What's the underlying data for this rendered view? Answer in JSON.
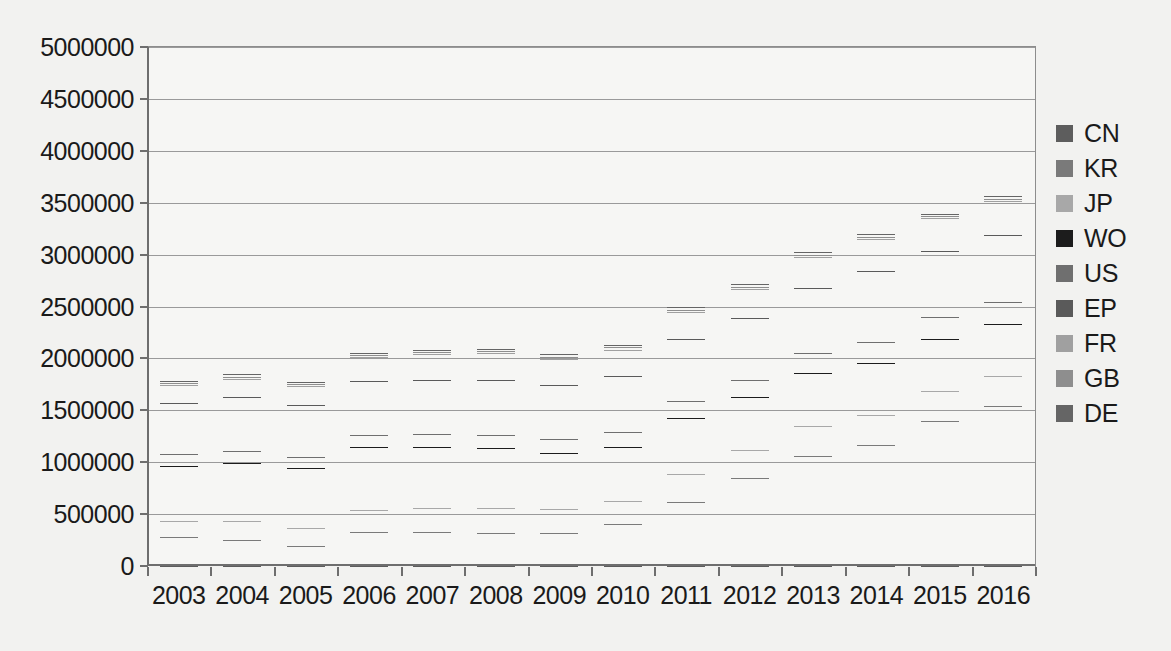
{
  "chart_data": {
    "type": "bar",
    "subtype": "stacked-bar",
    "title": "",
    "xlabel": "",
    "ylabel": "",
    "grid": true,
    "legend_position": "right",
    "ylim": [
      0,
      5000000
    ],
    "ytick_step": 500000,
    "ytick_labels": [
      "5000000",
      "4500000",
      "4000000",
      "3500000",
      "3000000",
      "2500000",
      "2000000",
      "1500000",
      "1000000",
      "500000",
      "0"
    ],
    "ytick_values": [
      5000000,
      4500000,
      4000000,
      3500000,
      3000000,
      2500000,
      2000000,
      1500000,
      1000000,
      500000,
      0
    ],
    "categories": [
      "2003",
      "2004",
      "2005",
      "2006",
      "2007",
      "2008",
      "2009",
      "2010",
      "2011",
      "2012",
      "2013",
      "2014",
      "2015",
      "2016"
    ],
    "stack_order_bottom_to_top": [
      "DE",
      "GB",
      "FR",
      "EP",
      "US",
      "WO",
      "JP",
      "KR",
      "CN"
    ],
    "series": [
      {
        "name": "CN",
        "color": "#5d5d5d",
        "values": [
          275000,
          250000,
          190000,
          330000,
          330000,
          320000,
          315000,
          400000,
          620000,
          850000,
          1060000,
          1170000,
          1400000,
          1540000
        ]
      },
      {
        "name": "KR",
        "color": "#7a7a7a",
        "values": [
          160000,
          180000,
          180000,
          210000,
          230000,
          240000,
          230000,
          230000,
          270000,
          270000,
          290000,
          280000,
          290000,
          290000
        ]
      },
      {
        "name": "JP",
        "color": "#a8a8a8",
        "values": [
          530000,
          560000,
          570000,
          610000,
          590000,
          580000,
          540000,
          520000,
          540000,
          510000,
          510000,
          510000,
          500000,
          500000
        ]
      },
      {
        "name": "WO",
        "color": "#1c1c1c",
        "values": [
          110000,
          115000,
          110000,
          110000,
          120000,
          125000,
          140000,
          140000,
          160000,
          160000,
          190000,
          200000,
          205000,
          215000
        ]
      },
      {
        "name": "US",
        "color": "#6f6f6f",
        "values": [
          500000,
          520000,
          500000,
          520000,
          520000,
          530000,
          520000,
          545000,
          595000,
          600000,
          625000,
          680000,
          635000,
          640000
        ]
      },
      {
        "name": "EP",
        "color": "#5a5a5a",
        "values": [
          165000,
          175000,
          180000,
          230000,
          250000,
          255000,
          250000,
          250000,
          265000,
          280000,
          305000,
          310000,
          320000,
          335000
        ]
      },
      {
        "name": "FR",
        "color": "#a0a0a0",
        "values": [
          20000,
          20000,
          20000,
          20000,
          20000,
          20000,
          20000,
          20000,
          20000,
          20000,
          20000,
          20000,
          20000,
          20000
        ]
      },
      {
        "name": "GB",
        "color": "#8e8e8e",
        "values": [
          25000,
          25000,
          25000,
          25000,
          25000,
          25000,
          25000,
          25000,
          25000,
          25000,
          25000,
          25000,
          25000,
          25000
        ]
      },
      {
        "name": "DE",
        "color": "#656565",
        "values": [
          35000,
          100000,
          40000,
          140000,
          195000,
          280000,
          405000,
          525000,
          480000,
          640000,
          700000,
          700000,
          850000,
          880000
        ]
      }
    ],
    "totals": [
      1820000,
      1945000,
      1815000,
      2195000,
      2280000,
      2375000,
      2445000,
      2655000,
      2975000,
      3355000,
      3725000,
      3895000,
      4245000,
      4445000
    ]
  },
  "legend": {
    "items": [
      {
        "label": "CN",
        "color": "#5d5d5d"
      },
      {
        "label": "KR",
        "color": "#7a7a7a"
      },
      {
        "label": "JP",
        "color": "#a8a8a8"
      },
      {
        "label": "WO",
        "color": "#1c1c1c"
      },
      {
        "label": "US",
        "color": "#6f6f6f"
      },
      {
        "label": "EP",
        "color": "#5a5a5a"
      },
      {
        "label": "FR",
        "color": "#a0a0a0"
      },
      {
        "label": "GB",
        "color": "#8e8e8e"
      },
      {
        "label": "DE",
        "color": "#656565"
      }
    ]
  },
  "colors": {
    "background": "#f2f2f0",
    "plot_background": "#f6f6f4",
    "axis": "#6e6e6e",
    "gridline": "#9a9a9a",
    "text": "#1a1a1a"
  }
}
